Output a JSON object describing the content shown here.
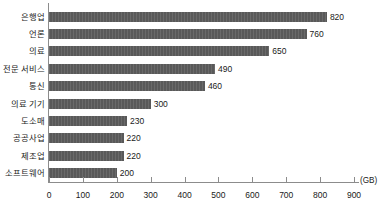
{
  "chart_data": {
    "type": "bar",
    "orientation": "horizontal",
    "title": "",
    "xlabel": "(GB)",
    "ylabel": "",
    "unit": "(GB)",
    "xlim": [
      0,
      900
    ],
    "xticks": [
      0,
      100,
      200,
      300,
      400,
      500,
      600,
      700,
      800,
      900
    ],
    "grid": false,
    "legend": false,
    "bar_color": "#595959",
    "axis_color": "#8c8c8c",
    "text_color": "#1a1a1a",
    "categories": [
      "은행업",
      "언론",
      "의료",
      "전문 서비스",
      "통신",
      "의료 기기",
      "도소매",
      "공공사업",
      "제조업",
      "소프트웨어"
    ],
    "values": [
      820,
      760,
      650,
      490,
      460,
      300,
      230,
      220,
      220,
      200
    ],
    "data_labels": [
      "820",
      "760",
      "650",
      "490",
      "460",
      "300",
      "230",
      "220",
      "220",
      "200"
    ],
    "tick_labels": [
      "0",
      "100",
      "200",
      "300",
      "400",
      "500",
      "600",
      "700",
      "800",
      "900"
    ]
  }
}
